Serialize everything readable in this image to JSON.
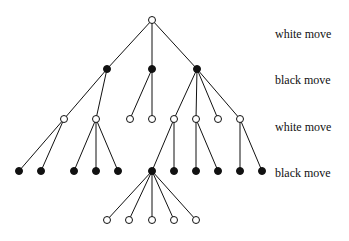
{
  "diagram": {
    "type": "game-tree",
    "node_radius": 3.5,
    "colors": {
      "line": "#111111",
      "white_node_fill": "#ffffff",
      "black_node_fill": "#111111"
    },
    "levels": [
      {
        "depth": 0,
        "label": "white move",
        "label_y": 28
      },
      {
        "depth": 1,
        "label": "black move",
        "label_y": 74
      },
      {
        "depth": 2,
        "label": "white move",
        "label_y": 121
      },
      {
        "depth": 3,
        "label": "black move",
        "label_y": 167
      }
    ],
    "label_x": 275,
    "nodes": [
      {
        "id": "r",
        "x": 152,
        "y": 20,
        "color": "white",
        "parent": null
      },
      {
        "id": "b1",
        "x": 107,
        "y": 69,
        "color": "black",
        "parent": "r"
      },
      {
        "id": "b2",
        "x": 152,
        "y": 69,
        "color": "black",
        "parent": "r"
      },
      {
        "id": "b3",
        "x": 197,
        "y": 69,
        "color": "black",
        "parent": "r"
      },
      {
        "id": "w1",
        "x": 64,
        "y": 119,
        "color": "white",
        "parent": "b1"
      },
      {
        "id": "w2",
        "x": 96,
        "y": 119,
        "color": "white",
        "parent": "b1"
      },
      {
        "id": "w3",
        "x": 130,
        "y": 119,
        "color": "white",
        "parent": "b2"
      },
      {
        "id": "w4",
        "x": 152,
        "y": 119,
        "color": "white",
        "parent": "b2"
      },
      {
        "id": "w5",
        "x": 174,
        "y": 119,
        "color": "white",
        "parent": "b3"
      },
      {
        "id": "w6",
        "x": 196,
        "y": 119,
        "color": "white",
        "parent": "b3"
      },
      {
        "id": "w7",
        "x": 218,
        "y": 119,
        "color": "white",
        "parent": "b3"
      },
      {
        "id": "w8",
        "x": 240,
        "y": 119,
        "color": "white",
        "parent": "b3"
      },
      {
        "id": "k1",
        "x": 19,
        "y": 171,
        "color": "black",
        "parent": "w1"
      },
      {
        "id": "k2",
        "x": 41,
        "y": 171,
        "color": "black",
        "parent": "w1"
      },
      {
        "id": "k3",
        "x": 74,
        "y": 171,
        "color": "black",
        "parent": "w2"
      },
      {
        "id": "k4",
        "x": 96,
        "y": 171,
        "color": "black",
        "parent": "w2"
      },
      {
        "id": "k5",
        "x": 118,
        "y": 171,
        "color": "black",
        "parent": "w2"
      },
      {
        "id": "k6",
        "x": 152,
        "y": 171,
        "color": "black",
        "parent": "w5"
      },
      {
        "id": "k7",
        "x": 174,
        "y": 171,
        "color": "black",
        "parent": "w5"
      },
      {
        "id": "k8",
        "x": 196,
        "y": 171,
        "color": "black",
        "parent": "w6"
      },
      {
        "id": "k9",
        "x": 218,
        "y": 171,
        "color": "black",
        "parent": "w6"
      },
      {
        "id": "k10",
        "x": 240,
        "y": 171,
        "color": "black",
        "parent": "w8"
      },
      {
        "id": "k11",
        "x": 262,
        "y": 171,
        "color": "black",
        "parent": "w8"
      },
      {
        "id": "l1",
        "x": 107,
        "y": 220,
        "color": "white",
        "parent": "k6"
      },
      {
        "id": "l2",
        "x": 129,
        "y": 220,
        "color": "white",
        "parent": "k6"
      },
      {
        "id": "l3",
        "x": 152,
        "y": 220,
        "color": "white",
        "parent": "k6"
      },
      {
        "id": "l4",
        "x": 174,
        "y": 220,
        "color": "white",
        "parent": "k6"
      },
      {
        "id": "l5",
        "x": 196,
        "y": 220,
        "color": "white",
        "parent": "k6"
      }
    ]
  }
}
